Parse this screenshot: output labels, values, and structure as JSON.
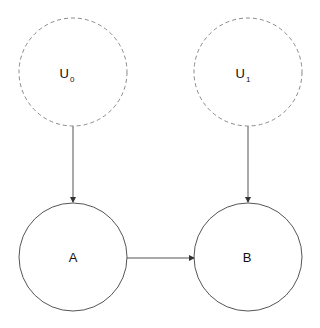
{
  "diagram": {
    "type": "causal-graph",
    "nodes": [
      {
        "id": "U0",
        "label": "U",
        "subscript": "0",
        "style": "dashed",
        "cx": 73,
        "cy": 72,
        "r": 54
      },
      {
        "id": "U1",
        "label": "U",
        "subscript": "1",
        "style": "dashed",
        "cx": 248,
        "cy": 72,
        "r": 54
      },
      {
        "id": "A",
        "label": "A",
        "subscript": "",
        "style": "solid",
        "cx": 73,
        "cy": 257,
        "r": 54
      },
      {
        "id": "B",
        "label": "B",
        "subscript": "",
        "style": "solid",
        "cx": 248,
        "cy": 257,
        "r": 54
      }
    ],
    "edges": [
      {
        "from": "U0",
        "to": "A"
      },
      {
        "from": "U1",
        "to": "B"
      },
      {
        "from": "A",
        "to": "B"
      }
    ],
    "colors": {
      "dashed_stroke": "#8a8a8a",
      "solid_stroke": "#555555",
      "edge": "#555555",
      "text": "#111111"
    }
  }
}
